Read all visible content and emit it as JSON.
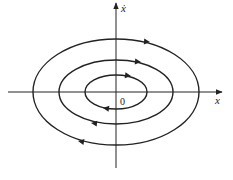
{
  "diagram": {
    "type": "phase-portrait",
    "axes": {
      "x_label": "x",
      "y_label": "ẋ",
      "origin_label": "0"
    },
    "orbits": [
      {
        "name": "inner",
        "rx": 31,
        "ry": 17
      },
      {
        "name": "middle",
        "rx": 57,
        "ry": 32
      },
      {
        "name": "outer",
        "rx": 83,
        "ry": 53
      }
    ],
    "direction": "clockwise",
    "colors": {
      "stroke": "#222222",
      "background": "#ffffff"
    }
  }
}
